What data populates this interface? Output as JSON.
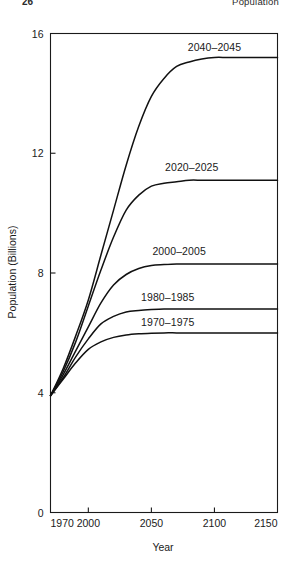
{
  "running_head": {
    "folio": "26",
    "title": "Population"
  },
  "chart_data": {
    "type": "line",
    "title": "",
    "xlabel": "Year",
    "ylabel": "Population (Billions)",
    "xlim": [
      1970,
      2150
    ],
    "ylim": [
      0,
      16
    ],
    "xticks": [
      1970,
      2000,
      2050,
      2100,
      2150
    ],
    "xticklabels": [
      "1970",
      "2000",
      "2050",
      "2100",
      "2150"
    ],
    "yticks": [
      0,
      4,
      8,
      12,
      16
    ],
    "yticklabels": [
      "0",
      "4",
      "8",
      "12",
      "16"
    ],
    "grid": false,
    "legend_position": "inline-right-of-curve",
    "start_year": 1970,
    "start_value": 3.9,
    "series": [
      {
        "name": "2040-2045",
        "label": "2040–2045",
        "plateau": 15.2,
        "midpoint_year": 2038,
        "growth_rate": 0.048,
        "label_x": 2100,
        "label_y": 15.55,
        "x": [
          1970,
          1980,
          1990,
          2000,
          2010,
          2020,
          2030,
          2040,
          2050,
          2060,
          2070,
          2080,
          2090,
          2100,
          2110,
          2120,
          2130,
          2140,
          2150
        ],
        "y": [
          3.9,
          4.8,
          5.9,
          7.1,
          8.6,
          10.1,
          11.6,
          12.9,
          13.9,
          14.5,
          14.9,
          15.05,
          15.15,
          15.2,
          15.2,
          15.2,
          15.2,
          15.2,
          15.2
        ]
      },
      {
        "name": "2020-2025",
        "label": "2020–2025",
        "plateau": 11.1,
        "midpoint_year": 2020,
        "growth_rate": 0.052,
        "label_x": 2082,
        "label_y": 11.55,
        "x": [
          1970,
          1980,
          1990,
          2000,
          2010,
          2020,
          2030,
          2040,
          2050,
          2060,
          2070,
          2080,
          2090,
          2100,
          2110,
          2120,
          2130,
          2140,
          2150
        ],
        "y": [
          3.9,
          4.7,
          5.7,
          6.9,
          8.1,
          9.2,
          10.1,
          10.6,
          10.9,
          11.0,
          11.05,
          11.1,
          11.1,
          11.1,
          11.1,
          11.1,
          11.1,
          11.1,
          11.1
        ]
      },
      {
        "name": "2000-2005",
        "label": "2000–2005",
        "plateau": 8.3,
        "midpoint_year": 2002,
        "growth_rate": 0.058,
        "label_x": 2072,
        "label_y": 8.75,
        "x": [
          1970,
          1980,
          1990,
          2000,
          2010,
          2020,
          2030,
          2040,
          2050,
          2060,
          2070,
          2080,
          2090,
          2100,
          2110,
          2120,
          2130,
          2140,
          2150
        ],
        "y": [
          3.9,
          4.6,
          5.4,
          6.2,
          7.0,
          7.6,
          7.95,
          8.15,
          8.25,
          8.28,
          8.3,
          8.3,
          8.3,
          8.3,
          8.3,
          8.3,
          8.3,
          8.3,
          8.3
        ]
      },
      {
        "name": "1980-1985",
        "label": "1980–1985",
        "plateau": 6.8,
        "midpoint_year": 1992,
        "growth_rate": 0.062,
        "label_x": 2063,
        "label_y": 7.2,
        "x": [
          1970,
          1980,
          1990,
          2000,
          2010,
          2020,
          2030,
          2040,
          2050,
          2060,
          2070,
          2080,
          2090,
          2100,
          2110,
          2120,
          2130,
          2140,
          2150
        ],
        "y": [
          3.9,
          4.5,
          5.2,
          5.8,
          6.3,
          6.55,
          6.7,
          6.75,
          6.78,
          6.8,
          6.8,
          6.8,
          6.8,
          6.8,
          6.8,
          6.8,
          6.8,
          6.8,
          6.8
        ]
      },
      {
        "name": "1970-1975",
        "label": "1970–1975",
        "plateau": 6.0,
        "midpoint_year": 1988,
        "growth_rate": 0.066,
        "label_x": 2063,
        "label_y": 6.35,
        "x": [
          1970,
          1980,
          1990,
          2000,
          2010,
          2020,
          2030,
          2040,
          2050,
          2060,
          2070,
          2080,
          2090,
          2100,
          2110,
          2120,
          2130,
          2140,
          2150
        ],
        "y": [
          3.9,
          4.45,
          5.0,
          5.45,
          5.7,
          5.85,
          5.93,
          5.97,
          5.99,
          6.0,
          6.0,
          6.0,
          6.0,
          6.0,
          6.0,
          6.0,
          6.0,
          6.0,
          6.0
        ]
      }
    ]
  }
}
